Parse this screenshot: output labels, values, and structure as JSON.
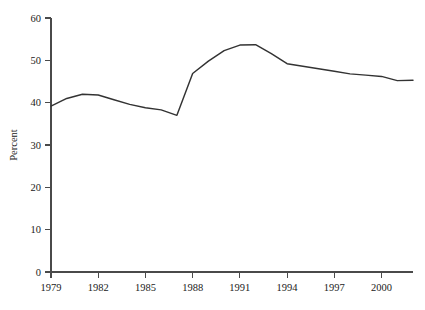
{
  "chart_data": {
    "type": "line",
    "title": "",
    "subtitle": "",
    "xlabel": "",
    "ylabel": "Percent",
    "xlim": [
      1979,
      2002
    ],
    "ylim": [
      0,
      60
    ],
    "grid": false,
    "legend": false,
    "legend_position": "none",
    "line_color": "#333333",
    "axis_color": "#4a4a4a",
    "x_tick_labels": [
      "1979",
      "1982",
      "1985",
      "1988",
      "1991",
      "1994",
      "1997",
      "2000"
    ],
    "x_tick_values": [
      1979,
      1982,
      1985,
      1988,
      1991,
      1994,
      1997,
      2000
    ],
    "y_tick_labels": [
      "0",
      "10",
      "20",
      "30",
      "40",
      "50",
      "60"
    ],
    "y_tick_values": [
      0,
      10,
      20,
      30,
      40,
      50,
      60
    ],
    "series": [
      {
        "name": "Percent",
        "x": [
          1979,
          1980,
          1981,
          1982,
          1983,
          1984,
          1985,
          1986,
          1987,
          1988,
          1989,
          1990,
          1991,
          1992,
          1993,
          1994,
          1995,
          1996,
          1997,
          1998,
          1999,
          2000,
          2001,
          2002
        ],
        "values": [
          39.2,
          41.0,
          42.0,
          41.8,
          40.7,
          39.6,
          38.8,
          38.3,
          37.0,
          46.9,
          49.8,
          52.3,
          53.6,
          53.7,
          51.6,
          49.2,
          48.6,
          48.0,
          47.4,
          46.8,
          46.5,
          46.2,
          45.2,
          45.3
        ]
      }
    ]
  }
}
